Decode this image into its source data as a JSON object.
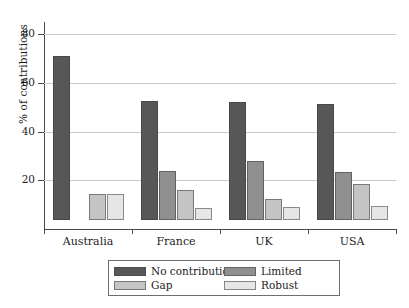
{
  "chart_data": {
    "type": "bar",
    "title": "",
    "xlabel": "",
    "ylabel": "% of contributions",
    "ylim": [
      0,
      85
    ],
    "yticks": [
      20,
      40,
      60,
      80
    ],
    "ytick_labels": [
      "20",
      "40",
      "60",
      "80"
    ],
    "grid": true,
    "legend_position": "bottom",
    "categories": [
      "Australia",
      "France",
      "UK",
      "USA"
    ],
    "series": [
      {
        "name": "No contribution",
        "color": "#575757",
        "values": [
          71,
          52.5,
          52,
          51.5
        ]
      },
      {
        "name": "Limited",
        "color": "#909090",
        "values": [
          0,
          24,
          28,
          23.5
        ]
      },
      {
        "name": "Gap",
        "color": "#c4c4c4",
        "values": [
          14.5,
          16,
          12.5,
          18.5
        ]
      },
      {
        "name": "Robust",
        "color": "#e6e6e6",
        "values": [
          14.5,
          8.5,
          9,
          9.5
        ]
      }
    ]
  },
  "legend": {
    "entries": [
      {
        "label": "No contribution",
        "swatch": "no-contribution"
      },
      {
        "label": "Limited",
        "swatch": "limited"
      },
      {
        "label": "Gap",
        "swatch": "gap"
      },
      {
        "label": "Robust",
        "swatch": "robust"
      }
    ]
  }
}
